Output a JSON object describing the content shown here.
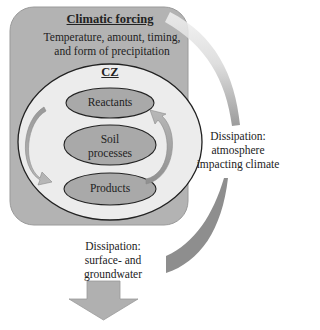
{
  "diagram": {
    "outer_box": {
      "title": "Climatic forcing",
      "subtitle_line1": "Temperature, amount, timing,",
      "subtitle_line2": "and form of precipitation",
      "fill": "#b3b3b3"
    },
    "cz_circle": {
      "title": "CZ",
      "fill": "#e8e8e8"
    },
    "nodes": [
      {
        "id": "reactants",
        "label": "Reactants"
      },
      {
        "id": "soil-processes",
        "label_line1": "Soil",
        "label_line2": "processes"
      },
      {
        "id": "products",
        "label": "Products"
      }
    ],
    "node_fill": "#a9a9a9",
    "arrows": {
      "cycle_left": "Reactants to Products",
      "cycle_right": "Products to Reactants",
      "arrow_color": "#8c8c8c"
    },
    "dissipation_atmosphere": {
      "line1": "Dissipation:",
      "line2": "atmosphere",
      "line3": "impacting climate"
    },
    "dissipation_water": {
      "line1": "Dissipation:",
      "line2": "surface- and",
      "line3": "groundwater"
    }
  }
}
